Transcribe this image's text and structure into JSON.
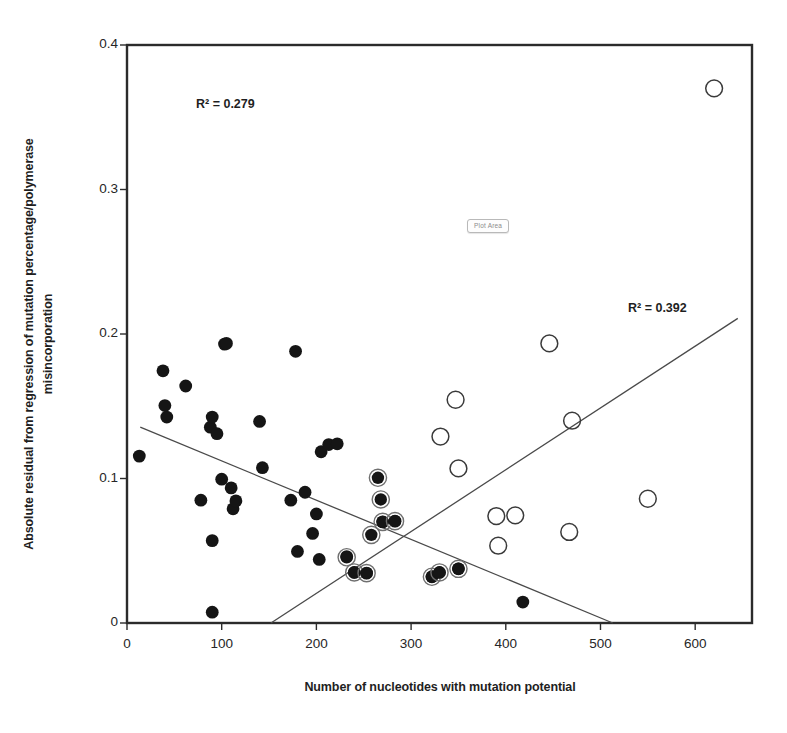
{
  "chart_data": {
    "type": "scatter",
    "title": "",
    "xlabel": "Number of nucleotides with mutation potential",
    "ylabel_line1": "Absolute residual from regression of mutation percentage/polymerase",
    "ylabel_line2": "misincorporation",
    "xlim": [
      0,
      660
    ],
    "ylim": [
      0,
      0.4
    ],
    "xticks": [
      0,
      100,
      200,
      300,
      400,
      500,
      600
    ],
    "xtick_labels": [
      "0",
      "100",
      "200",
      "300",
      "400",
      "500",
      "600"
    ],
    "yticks": [
      0,
      0.1,
      0.2,
      0.3,
      0.4
    ],
    "ytick_labels": [
      "0",
      "0.1",
      "0.2",
      "0.3",
      "0.4"
    ],
    "grid": false,
    "legend": "none",
    "frame": "box",
    "annotations": [
      {
        "name": "r2-left",
        "text": "R² = 0.279"
      },
      {
        "name": "r2-right",
        "text": "R² = 0.392"
      },
      {
        "name": "plot-area-tooltip",
        "text": "Plot Area"
      }
    ],
    "series": [
      {
        "name": "filled-circles",
        "marker": "filled-circle",
        "color": "#151515",
        "points": [
          [
            13,
            0.1155
          ],
          [
            38,
            0.1745
          ],
          [
            42,
            0.1425
          ],
          [
            40,
            0.1505
          ],
          [
            62,
            0.164
          ],
          [
            78,
            0.085
          ],
          [
            88,
            0.1355
          ],
          [
            90,
            0.1425
          ],
          [
            95,
            0.131
          ],
          [
            103,
            0.193
          ],
          [
            105,
            0.1935
          ],
          [
            100,
            0.0995
          ],
          [
            110,
            0.0935
          ],
          [
            112,
            0.079
          ],
          [
            115,
            0.0845
          ],
          [
            90,
            0.057
          ],
          [
            90,
            0.0075
          ],
          [
            140,
            0.1395
          ],
          [
            143,
            0.1075
          ],
          [
            173,
            0.085
          ],
          [
            178,
            0.188
          ],
          [
            180,
            0.0495
          ],
          [
            188,
            0.0905
          ],
          [
            196,
            0.062
          ],
          [
            200,
            0.0755
          ],
          [
            203,
            0.044
          ],
          [
            205,
            0.1185
          ],
          [
            213,
            0.1235
          ],
          [
            222,
            0.124
          ],
          [
            232,
            0.046
          ],
          [
            240,
            0.035
          ],
          [
            253,
            0.0345
          ],
          [
            270,
            0.07
          ],
          [
            283,
            0.0705
          ],
          [
            322,
            0.032
          ],
          [
            330,
            0.035
          ],
          [
            350,
            0.0375
          ],
          [
            418,
            0.0145
          ]
        ]
      },
      {
        "name": "filled-circles-with-ring",
        "marker": "filled-circle-ring",
        "color": "#151515",
        "points": [
          [
            232,
            0.0455
          ],
          [
            240,
            0.035
          ],
          [
            253,
            0.0345
          ],
          [
            258,
            0.061
          ],
          [
            265,
            0.1005
          ],
          [
            268,
            0.0855
          ],
          [
            270,
            0.07
          ],
          [
            283,
            0.0705
          ],
          [
            322,
            0.032
          ],
          [
            330,
            0.035
          ],
          [
            350,
            0.0375
          ]
        ]
      },
      {
        "name": "open-circles",
        "marker": "open-circle",
        "color": "#3a3a3a",
        "points": [
          [
            331,
            0.129
          ],
          [
            347,
            0.1545
          ],
          [
            350,
            0.107
          ],
          [
            390,
            0.074
          ],
          [
            392,
            0.0535
          ],
          [
            410,
            0.0745
          ],
          [
            446,
            0.1935
          ],
          [
            467,
            0.063
          ],
          [
            470,
            0.14
          ],
          [
            550,
            0.086
          ],
          [
            620,
            0.37
          ]
        ]
      }
    ],
    "trendlines": [
      {
        "name": "descending-trendline",
        "r2": 0.279,
        "x_start": 14,
        "y_start": 0.1355,
        "x_end": 513,
        "y_end": 0.0
      },
      {
        "name": "ascending-trendline",
        "r2": 0.392,
        "x_start": 152,
        "y_start": 0.0,
        "x_end": 645,
        "y_end": 0.2108
      }
    ]
  }
}
